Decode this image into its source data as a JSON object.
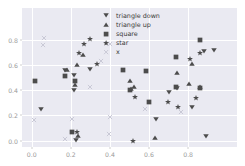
{
  "chart_data": {
    "type": "scatter",
    "title": "",
    "xlabel": "",
    "ylabel": "",
    "xlim": [
      -0.05,
      1.05
    ],
    "ylim": [
      -0.05,
      1.05
    ],
    "grid": true,
    "legend_position": "upper center",
    "xticks": [
      0.0,
      0.2,
      0.4,
      0.6,
      0.8
    ],
    "yticks": [
      0.0,
      0.2,
      0.4,
      0.6,
      0.8
    ],
    "xticklabels": [
      "0.0",
      "0.2",
      "0.4",
      "0.6",
      "0.8"
    ],
    "yticklabels": [
      "0.0",
      "0.2",
      "0.4",
      "0.6",
      "0.8"
    ],
    "marker_color": "#4c4c4c",
    "axes_facecolor": "#eaeaf2",
    "grid_color": "#ffffff",
    "tick_color": "#9a9a9a",
    "series": [
      {
        "name": "triangle down",
        "marker": "v",
        "points": [
          [
            0.172,
            0.561
          ],
          [
            0.214,
            0.516
          ],
          [
            0.216,
            0.401
          ],
          [
            0.3,
            0.566
          ],
          [
            0.048,
            0.253
          ],
          [
            0.227,
            0.003
          ],
          [
            0.636,
            0.174
          ],
          [
            0.742,
            0.418
          ],
          [
            0.818,
            0.268
          ],
          [
            0.7,
            0.386
          ],
          [
            0.879,
            0.706
          ],
          [
            0.931,
            0.719
          ],
          [
            0.893,
            0.036
          ]
        ]
      },
      {
        "name": "triangle up",
        "marker": "^",
        "points": [
          [
            0.182,
            0.561
          ],
          [
            0.222,
            0.443
          ],
          [
            0.233,
            0.601
          ],
          [
            0.262,
            0.682
          ],
          [
            0.504,
            0.47
          ],
          [
            0.51,
            0.411
          ],
          [
            0.522,
            0.424
          ],
          [
            0.742,
            0.535
          ],
          [
            0.632,
            0.022
          ],
          [
            0.806,
            0.447
          ],
          [
            0.822,
            0.604
          ],
          [
            0.861,
            0.425
          ],
          [
            0.235,
            0.038
          ]
        ]
      },
      {
        "name": "square",
        "marker": "s",
        "points": [
          [
            0.016,
            0.471
          ],
          [
            0.172,
            0.515
          ],
          [
            0.222,
            0.47
          ],
          [
            0.205,
            0.068
          ],
          [
            0.469,
            0.556
          ],
          [
            0.584,
            0.549
          ],
          [
            0.503,
            0.405
          ],
          [
            0.598,
            0.303
          ],
          [
            0.738,
            0.428
          ],
          [
            0.74,
            0.66
          ],
          [
            0.862,
            0.42
          ],
          [
            0.861,
            0.793
          ]
        ]
      },
      {
        "name": "star",
        "marker": "*",
        "points": [
          [
            0.269,
            0.765
          ],
          [
            0.297,
            0.805
          ],
          [
            0.243,
            0.691
          ],
          [
            0.23,
            0.071
          ],
          [
            0.527,
            0.343
          ],
          [
            0.697,
            0.309
          ],
          [
            0.748,
            0.268
          ],
          [
            0.808,
            0.649
          ],
          [
            0.838,
            0.337
          ],
          [
            0.86,
            0.69
          ],
          [
            0.519,
            0.001
          ],
          [
            0.333,
            0.603
          ]
        ]
      },
      {
        "name": "x",
        "marker": "x",
        "points": [
          [
            0.065,
            0.809
          ],
          [
            0.059,
            0.76
          ],
          [
            0.011,
            0.162
          ],
          [
            0.207,
            0.175
          ],
          [
            0.3,
            0.424
          ],
          [
            0.354,
            0.633
          ],
          [
            0.396,
            0.049
          ],
          [
            0.4,
            0.19
          ],
          [
            0.763,
            0.227
          ],
          [
            0.402,
            0.766
          ],
          [
            0.17,
            0.012
          ],
          [
            0.58,
            0.247
          ]
        ]
      }
    ]
  },
  "legend": {
    "entries": [
      {
        "label": "triangle down",
        "marker": "v"
      },
      {
        "label": "triangle up",
        "marker": "^"
      },
      {
        "label": "square",
        "marker": "s"
      },
      {
        "label": "star",
        "marker": "*"
      },
      {
        "label": "x",
        "marker": "x"
      }
    ]
  }
}
